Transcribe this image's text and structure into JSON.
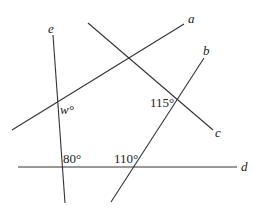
{
  "diagram": {
    "lines": [
      {
        "name": "a",
        "x1": 12,
        "y1": 130,
        "x2": 184,
        "y2": 24,
        "label": "a",
        "lx": 188,
        "ly": 23
      },
      {
        "name": "b",
        "x1": 204,
        "y1": 58,
        "x2": 111,
        "y2": 202,
        "label": "b",
        "lx": 203,
        "ly": 55
      },
      {
        "name": "c",
        "x1": 88,
        "y1": 23,
        "x2": 213,
        "y2": 130,
        "label": "c",
        "lx": 215,
        "ly": 137
      },
      {
        "name": "d",
        "x1": 18,
        "y1": 167,
        "x2": 237,
        "y2": 167,
        "label": "d",
        "lx": 241,
        "ly": 171
      },
      {
        "name": "e",
        "x1": 53,
        "y1": 35,
        "x2": 65,
        "y2": 203,
        "label": "e",
        "lx": 48,
        "ly": 33
      }
    ],
    "angles": [
      {
        "label": "w°",
        "x": 60,
        "y": 114,
        "italic": true
      },
      {
        "label": "115°",
        "x": 150,
        "y": 107,
        "italic": false
      },
      {
        "label": "80°",
        "x": 63,
        "y": 163,
        "italic": false
      },
      {
        "label": "110°",
        "x": 114,
        "y": 163,
        "italic": false
      }
    ]
  }
}
